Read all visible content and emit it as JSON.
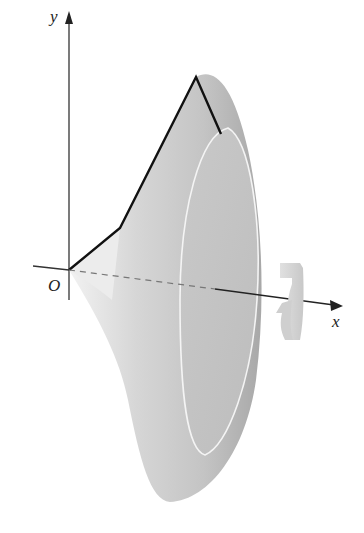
{
  "figure": {
    "axes": {
      "x_label": "x",
      "y_label": "y",
      "origin_label": "O"
    },
    "curve": {
      "type": "piecewise-linear",
      "points_px": [
        [
          69,
          270
        ],
        [
          120,
          228
        ],
        [
          196,
          77
        ],
        [
          221,
          134
        ]
      ]
    },
    "rotation_indicator": "rotation-arrow-about-x-axis",
    "colors": {
      "solid_light": "#e4e4e4",
      "solid_mid": "#c9c9c9",
      "solid_dark": "#a9a9a9",
      "face": "#c2c2c2",
      "curve": "#111111",
      "axis": "#333333"
    }
  }
}
